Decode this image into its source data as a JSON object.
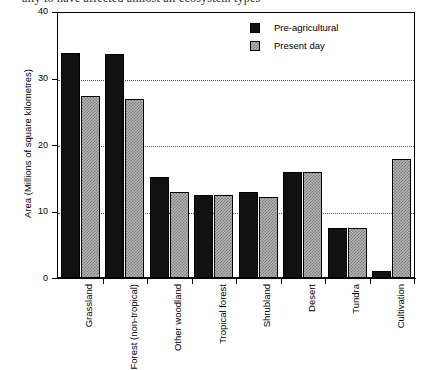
{
  "top_caption": "ally to have affected almost all ecosystem types",
  "legend": {
    "position": "top-right",
    "entries": [
      {
        "label": "Pre-agricultural",
        "swatch": "black-solid",
        "color": "#111111"
      },
      {
        "label": "Present day",
        "swatch": "grey-hatched",
        "color": "#b4b4b4"
      }
    ]
  },
  "axes": {
    "y_title": "Area (Millions of square kilometres)",
    "y_ticks": [
      "0",
      "10",
      "20",
      "30",
      "40"
    ],
    "x_title": ""
  },
  "chart_data": {
    "type": "bar",
    "title": "",
    "subtitle": "",
    "xlabel": "",
    "ylabel": "Area (Millions of square kilometres)",
    "ylim": [
      0,
      40
    ],
    "yticks": [
      0,
      10,
      20,
      30,
      40
    ],
    "grid": "horizontal-dotted",
    "legend_position": "top-right",
    "categories": [
      "Grassland",
      "Forest (non-tropical)",
      "Other woodland",
      "Tropical forest",
      "Shrubland",
      "Desert",
      "Tundra",
      "Cultivation"
    ],
    "series": [
      {
        "name": "Pre-agricultural",
        "color": "#111111",
        "values": [
          34.0,
          33.8,
          15.2,
          12.5,
          13.0,
          16.0,
          7.5,
          1.0
        ]
      },
      {
        "name": "Present day",
        "color": "#b4b4b4",
        "values": [
          27.5,
          27.0,
          13.0,
          12.5,
          12.2,
          16.0,
          7.5,
          18.0
        ]
      }
    ]
  }
}
